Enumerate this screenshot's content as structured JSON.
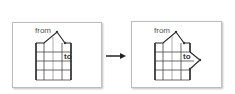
{
  "diagram": {
    "before": {
      "from_label": "from",
      "to_label": "to"
    },
    "after": {
      "from_label": "from",
      "to_label": "to"
    },
    "transition": "arrow-right"
  }
}
